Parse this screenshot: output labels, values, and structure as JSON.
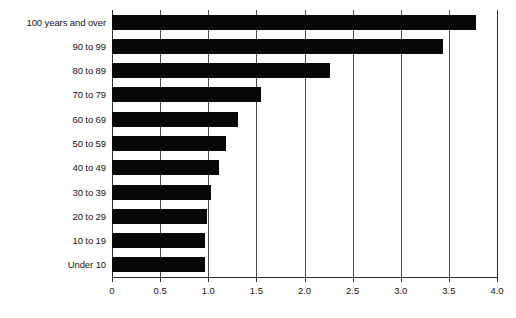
{
  "chart_data": {
    "type": "bar",
    "orientation": "horizontal",
    "title": "",
    "subtitle": "",
    "xlabel": "",
    "ylabel": "",
    "xlim": [
      0,
      4.0
    ],
    "xticks": [
      0,
      0.5,
      1.0,
      1.5,
      2.0,
      2.5,
      3.0,
      3.5,
      4.0
    ],
    "xtick_labels": [
      "0",
      "0.5",
      "1.0",
      "1.5",
      "2.0",
      "2.5",
      "3.0",
      "3.5",
      "4.0"
    ],
    "grid": "vertical",
    "legend": "none",
    "categories": [
      "100 years and over",
      "90 to 99",
      "80 to 89",
      "70 to 79",
      "60 to 69",
      "50 to 59",
      "40 to 49",
      "30 to 39",
      "20 to 29",
      "10 to 19",
      "Under 10"
    ],
    "values": [
      3.78,
      3.44,
      2.26,
      1.55,
      1.31,
      1.18,
      1.11,
      1.03,
      0.99,
      0.97,
      0.97
    ],
    "bar_color": "#080808",
    "axis_color": "#2b2b2b",
    "grid_color": "#4a4a4a",
    "background_color": "#ffffff"
  }
}
